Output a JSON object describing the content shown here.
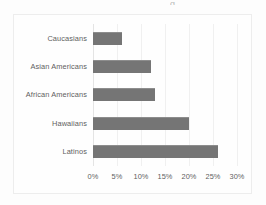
{
  "chart_data": {
    "type": "bar",
    "orientation": "horizontal",
    "title": "",
    "xlabel": "",
    "ylabel": "",
    "categories": [
      "Caucasians",
      "Asian Americans",
      "African Americans",
      "Hawaiians",
      "Latinos"
    ],
    "values": [
      6,
      12,
      13,
      20,
      26
    ],
    "value_unit": "%",
    "xlim": [
      0,
      30
    ],
    "xticks": [
      0,
      5,
      10,
      15,
      20,
      25,
      30
    ],
    "xtick_labels": [
      "0%",
      "5%",
      "10%",
      "15%",
      "20%",
      "25%",
      "30%"
    ],
    "grid": true,
    "grid_axis": "x",
    "legend": false,
    "bar_color": "#757575",
    "plot_background": "#fefefe",
    "gridline_color": "#f0f0f0",
    "tick_label_color": "#5f5f5f"
  },
  "title_fragment": "g"
}
